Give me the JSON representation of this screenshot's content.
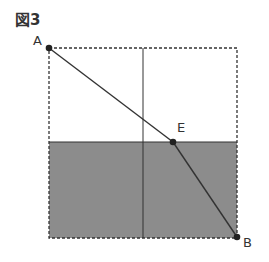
{
  "figure": {
    "title": "図3",
    "points": {
      "A": {
        "label": "A",
        "x": 49,
        "y": 48
      },
      "B": {
        "label": "B",
        "x": 237,
        "y": 237
      },
      "E": {
        "label": "E",
        "x": 173,
        "y": 142
      }
    },
    "square": {
      "x": 49,
      "y": 48,
      "size": 189
    },
    "divider_x": 143,
    "shade_top_y": 142,
    "colors": {
      "shade": "#8a8a8a",
      "line": "#333333",
      "dash": "#333333"
    }
  }
}
